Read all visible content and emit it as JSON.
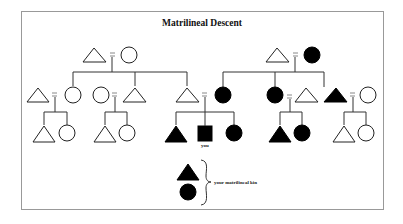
{
  "diagram": {
    "title": "Matrilineal Descent",
    "ego_label": "you",
    "legend_label": "your matrilineal kin",
    "colors": {
      "frame": "#999999",
      "filled": "#000000",
      "outline": "#222222",
      "marriage": "#888888"
    },
    "symbols": {
      "triangle": "male",
      "circle": "female",
      "square": "ego (you)",
      "filled": "matrilineal kin",
      "equals": "marriage"
    },
    "generations": [
      {
        "level": 1,
        "couples": [
          {
            "husband": "triangle-open",
            "wife": "circle-open"
          },
          {
            "husband": "triangle-open",
            "wife": "circle-filled"
          }
        ]
      },
      {
        "level": 2,
        "couples": [
          {
            "husband": "triangle-open",
            "wife": "circle-open"
          },
          {
            "wife": "circle-open",
            "husband": "triangle-open"
          },
          {
            "husband": "triangle-open",
            "wife": "circle-filled"
          },
          {
            "wife": "circle-filled",
            "husband": "triangle-open"
          },
          {
            "husband": "triangle-filled",
            "wife": "circle-open"
          }
        ]
      },
      {
        "level": 3,
        "sibling_sets": [
          [
            "triangle-open",
            "circle-open"
          ],
          [
            "triangle-open",
            "circle-open"
          ],
          [
            "triangle-filled",
            "square-filled (you)",
            "circle-filled"
          ],
          [
            "triangle-filled",
            "circle-filled"
          ],
          [
            "triangle-open",
            "circle-open"
          ]
        ]
      }
    ]
  }
}
